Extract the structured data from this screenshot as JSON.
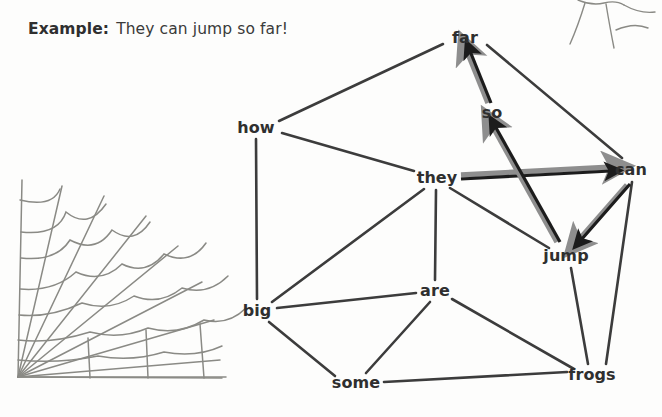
{
  "header": {
    "label": "Example:",
    "sentence": "They can jump so far!"
  },
  "colors": {
    "text": "#2f2f2f",
    "edge": "#3c3c3c",
    "arrow": "#1c1c1c",
    "arrow_shadow": "#8e8e8e",
    "web": "#8a8a85",
    "background": "#fdfdfc"
  },
  "graph": {
    "type": "word-association-network",
    "nodes": [
      {
        "id": "far",
        "label": "far",
        "x": 465,
        "y": 38
      },
      {
        "id": "so",
        "label": "so",
        "x": 492,
        "y": 113
      },
      {
        "id": "how",
        "label": "how",
        "x": 256,
        "y": 128
      },
      {
        "id": "they",
        "label": "they",
        "x": 437,
        "y": 178
      },
      {
        "id": "can",
        "label": "can",
        "x": 631,
        "y": 170
      },
      {
        "id": "jump",
        "label": "jump",
        "x": 566,
        "y": 256
      },
      {
        "id": "are",
        "label": "are",
        "x": 435,
        "y": 291
      },
      {
        "id": "big",
        "label": "big",
        "x": 257,
        "y": 311
      },
      {
        "id": "some",
        "label": "some",
        "x": 356,
        "y": 383
      },
      {
        "id": "frogs",
        "label": "frogs",
        "x": 592,
        "y": 375
      }
    ],
    "edges": [
      {
        "from": "how",
        "to": "far"
      },
      {
        "from": "far",
        "to": "can"
      },
      {
        "from": "how",
        "to": "they"
      },
      {
        "from": "how",
        "to": "big"
      },
      {
        "from": "big",
        "to": "they"
      },
      {
        "from": "big",
        "to": "are"
      },
      {
        "from": "big",
        "to": "some"
      },
      {
        "from": "they",
        "to": "are"
      },
      {
        "from": "they",
        "to": "jump"
      },
      {
        "from": "are",
        "to": "some"
      },
      {
        "from": "are",
        "to": "frogs"
      },
      {
        "from": "some",
        "to": "frogs"
      },
      {
        "from": "jump",
        "to": "frogs"
      },
      {
        "from": "can",
        "to": "frogs"
      }
    ],
    "path_arrows": [
      {
        "from": "they",
        "to": "can",
        "order": 1
      },
      {
        "from": "can",
        "to": "jump",
        "order": 2
      },
      {
        "from": "jump",
        "to": "so",
        "order": 3
      },
      {
        "from": "so",
        "to": "far",
        "order": 4
      }
    ],
    "path_sequence": [
      "they",
      "can",
      "jump",
      "so",
      "far"
    ]
  },
  "decorations": [
    {
      "name": "spider-web-bottom-left",
      "corner": "bottom-left"
    },
    {
      "name": "spider-web-top-right",
      "corner": "top-right"
    }
  ]
}
